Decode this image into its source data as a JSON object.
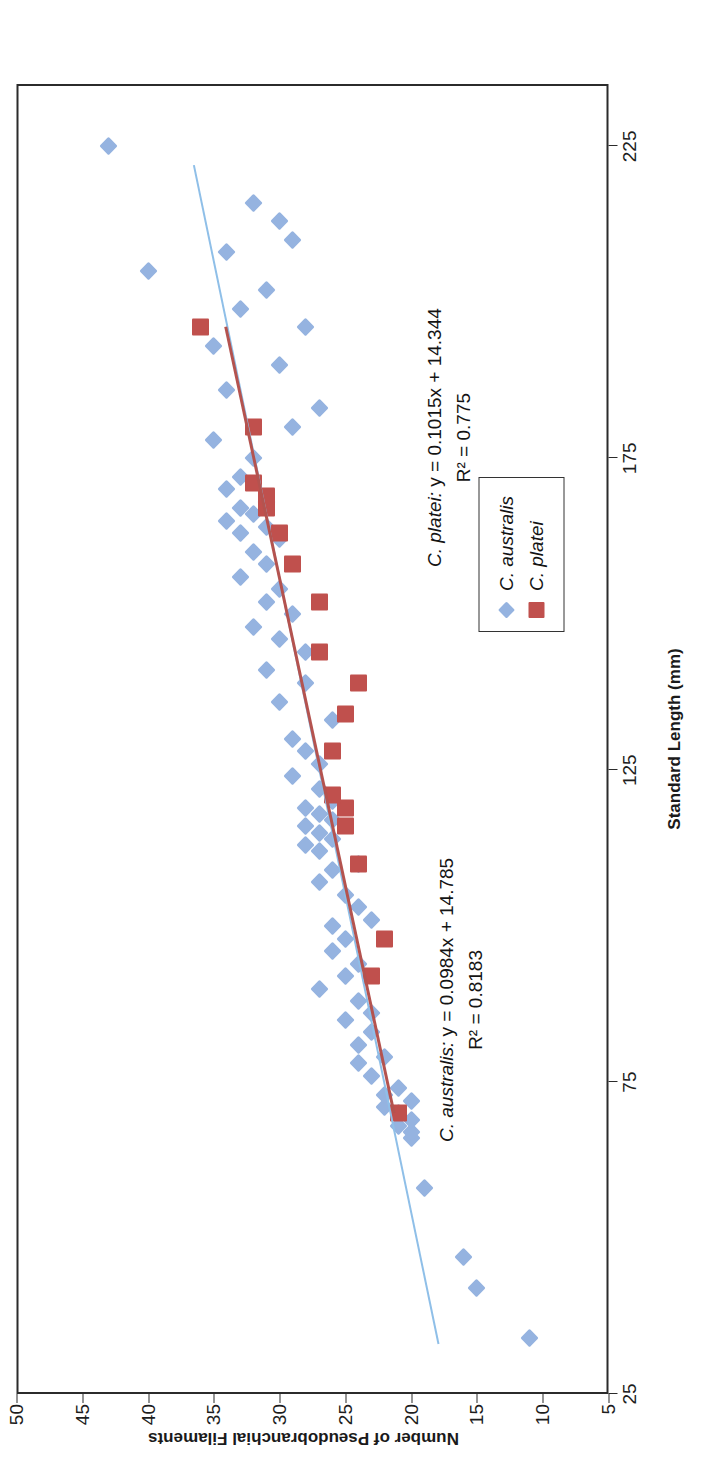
{
  "chart_data": {
    "type": "scatter",
    "title": "Callanthias",
    "xlabel": "Standard Length (mm)",
    "ylabel": "Number of Pseudobranchial Filaments",
    "xlim": [
      25,
      235
    ],
    "ylim": [
      5,
      50
    ],
    "xticks": [
      25,
      75,
      125,
      175,
      225
    ],
    "yticks": [
      5,
      10,
      15,
      20,
      25,
      30,
      35,
      40,
      45,
      50
    ],
    "grid": false,
    "legend_position": "bottom-right-inside",
    "legend": [
      {
        "name": "C. australis",
        "marker": "diamond",
        "color": "#95b3e0"
      },
      {
        "name": "C. platei",
        "marker": "square",
        "color": "#c0504d"
      }
    ],
    "annotations": [
      {
        "id": "australis-fit",
        "species": "C. australis",
        "equation": "y = 0.0984x + 14.785",
        "r2_label": "R² = 0.8183",
        "slope": 0.0984,
        "intercept": 14.785,
        "r2": 0.8183
      },
      {
        "id": "platei-fit",
        "species": "C. platei",
        "equation": "y = 0.1015x + 14.344",
        "r2_label": "R² = 0.775",
        "slope": 0.1015,
        "intercept": 14.344,
        "r2": 0.775
      }
    ],
    "series": [
      {
        "name": "C. australis",
        "marker": "diamond",
        "color": "#95b3e0",
        "trendline": {
          "slope": 0.0984,
          "intercept": 14.785,
          "x_start": 33,
          "x_end": 222,
          "color": "#8fbfe8"
        },
        "points": [
          [
            34,
            11
          ],
          [
            42,
            15
          ],
          [
            47,
            16
          ],
          [
            58,
            19
          ],
          [
            66,
            20
          ],
          [
            67,
            20
          ],
          [
            68,
            21
          ],
          [
            69,
            20
          ],
          [
            70,
            21
          ],
          [
            71,
            22
          ],
          [
            72,
            20
          ],
          [
            73,
            22
          ],
          [
            74,
            21
          ],
          [
            76,
            23
          ],
          [
            78,
            24
          ],
          [
            79,
            22
          ],
          [
            81,
            24
          ],
          [
            83,
            23
          ],
          [
            85,
            25
          ],
          [
            86,
            23
          ],
          [
            88,
            24
          ],
          [
            90,
            27
          ],
          [
            92,
            25
          ],
          [
            94,
            24
          ],
          [
            96,
            26
          ],
          [
            98,
            25
          ],
          [
            100,
            26
          ],
          [
            101,
            23
          ],
          [
            103,
            24
          ],
          [
            105,
            25
          ],
          [
            107,
            27
          ],
          [
            109,
            26
          ],
          [
            110,
            24
          ],
          [
            112,
            27
          ],
          [
            113,
            28
          ],
          [
            114,
            26
          ],
          [
            115,
            27
          ],
          [
            116,
            28
          ],
          [
            117,
            26
          ],
          [
            118,
            27
          ],
          [
            119,
            28
          ],
          [
            120,
            26
          ],
          [
            122,
            27
          ],
          [
            124,
            29
          ],
          [
            126,
            27
          ],
          [
            128,
            28
          ],
          [
            130,
            29
          ],
          [
            133,
            26
          ],
          [
            136,
            30
          ],
          [
            139,
            28
          ],
          [
            141,
            31
          ],
          [
            144,
            28
          ],
          [
            146,
            30
          ],
          [
            148,
            32
          ],
          [
            150,
            29
          ],
          [
            152,
            31
          ],
          [
            154,
            30
          ],
          [
            156,
            33
          ],
          [
            158,
            31
          ],
          [
            160,
            32
          ],
          [
            162,
            30
          ],
          [
            163,
            33
          ],
          [
            164,
            31
          ],
          [
            165,
            34
          ],
          [
            166,
            32
          ],
          [
            167,
            33
          ],
          [
            168,
            31
          ],
          [
            170,
            34
          ],
          [
            172,
            33
          ],
          [
            175,
            32
          ],
          [
            178,
            35
          ],
          [
            180,
            29
          ],
          [
            183,
            27
          ],
          [
            186,
            34
          ],
          [
            190,
            30
          ],
          [
            193,
            35
          ],
          [
            196,
            28
          ],
          [
            199,
            33
          ],
          [
            202,
            31
          ],
          [
            205,
            40
          ],
          [
            208,
            34
          ],
          [
            210,
            29
          ],
          [
            213,
            30
          ],
          [
            216,
            32
          ],
          [
            225,
            43
          ]
        ]
      },
      {
        "name": "C. platei",
        "marker": "square",
        "color": "#c0504d",
        "trendline": {
          "slope": 0.1015,
          "intercept": 14.344,
          "x_start": 70,
          "x_end": 196,
          "color": "#b4534f"
        },
        "points": [
          [
            70,
            21
          ],
          [
            92,
            23
          ],
          [
            98,
            22
          ],
          [
            110,
            24
          ],
          [
            116,
            25
          ],
          [
            119,
            25
          ],
          [
            121,
            26
          ],
          [
            128,
            26
          ],
          [
            134,
            25
          ],
          [
            139,
            24
          ],
          [
            144,
            27
          ],
          [
            152,
            27
          ],
          [
            158,
            29
          ],
          [
            163,
            30
          ],
          [
            167,
            31
          ],
          [
            168,
            31
          ],
          [
            169,
            31
          ],
          [
            171,
            32
          ],
          [
            180,
            32
          ],
          [
            196,
            36
          ]
        ]
      }
    ]
  }
}
